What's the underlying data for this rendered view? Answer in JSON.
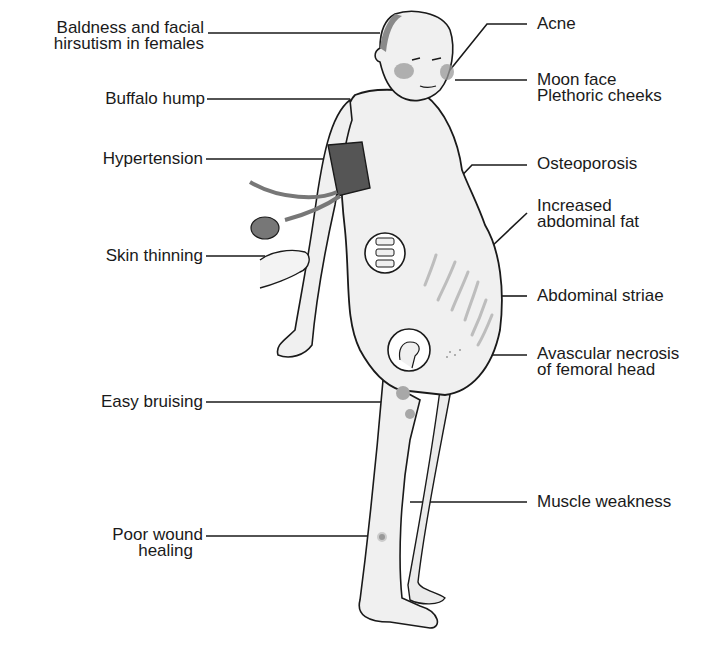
{
  "diagram": {
    "labels_left": [
      {
        "id": "baldness",
        "lines": [
          "Baldness and facial",
          "hirsutism in females"
        ]
      },
      {
        "id": "buffalo",
        "lines": [
          "Buffalo hump"
        ]
      },
      {
        "id": "hypertension",
        "lines": [
          "Hypertension"
        ]
      },
      {
        "id": "skin",
        "lines": [
          "Skin thinning"
        ]
      },
      {
        "id": "bruising",
        "lines": [
          "Easy bruising"
        ]
      },
      {
        "id": "wound",
        "lines": [
          "Poor wound",
          "healing"
        ]
      }
    ],
    "labels_right": [
      {
        "id": "acne",
        "lines": [
          "Acne"
        ]
      },
      {
        "id": "moon",
        "lines": [
          "Moon face",
          "Plethoric cheeks"
        ]
      },
      {
        "id": "osteo",
        "lines": [
          "Osteoporosis"
        ]
      },
      {
        "id": "abdfat",
        "lines": [
          "Increased",
          "abdominal fat"
        ]
      },
      {
        "id": "striae",
        "lines": [
          "Abdominal striae"
        ]
      },
      {
        "id": "avn",
        "lines": [
          "Avascular necrosis",
          "of femoral head"
        ]
      },
      {
        "id": "muscle",
        "lines": [
          "Muscle weakness"
        ]
      }
    ],
    "colors": {
      "line": "#1a1a1a",
      "skin": "#f0f0f0",
      "cuff": "#555555",
      "cheek": "#9a9a9a",
      "bruise": "#a8a8a8",
      "striae": "#bdbdbd"
    }
  }
}
